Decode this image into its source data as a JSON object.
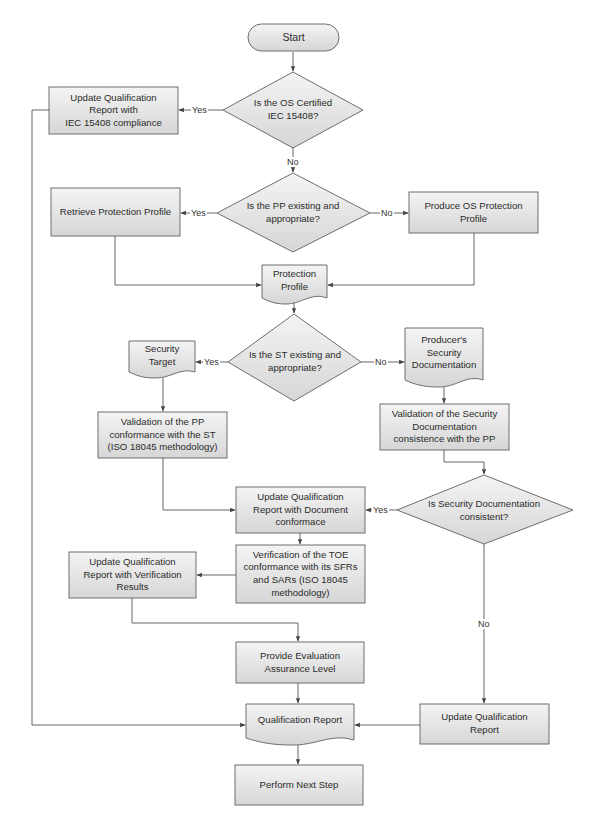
{
  "diagram": {
    "type": "flowchart",
    "colors": {
      "shape_fill_top": "#f4f4f4",
      "shape_fill_bottom": "#d6d6d6",
      "stroke": "#6e6e6e",
      "line": "#555555",
      "text": "#2b2b2b"
    },
    "nodes": {
      "start": {
        "shape": "terminator",
        "label": "Start"
      },
      "q_os_certified": {
        "shape": "decision",
        "label": "Is the OS Certified\nIEC 15408?"
      },
      "update_qr_iec": {
        "shape": "process",
        "label": "Update Qualification\nReport with\nIEC 15408 compliance"
      },
      "q_pp_existing": {
        "shape": "decision",
        "label": "Is the PP existing and\nappropriate?"
      },
      "retrieve_pp": {
        "shape": "process",
        "label": "Retrieve Protection Profile"
      },
      "produce_os_pp": {
        "shape": "process",
        "label": "Produce OS Protection\nProfile"
      },
      "protection_profile": {
        "shape": "document",
        "label": "Protection\nProfile"
      },
      "q_st_existing": {
        "shape": "decision",
        "label": "Is the ST existing and\nappropriate?"
      },
      "security_target": {
        "shape": "document",
        "label": "Security\nTarget"
      },
      "producers_sec_doc": {
        "shape": "document",
        "label": "Producer's\nSecurity\nDocumentation"
      },
      "validation_pp_st": {
        "shape": "process",
        "label": "Validation of the PP\nconformance with the ST\n(ISO 18045 methodology)"
      },
      "validation_secdoc": {
        "shape": "process",
        "label": "Validation of the Security\nDocumentation\nconsistence with the PP"
      },
      "update_qr_doc": {
        "shape": "process",
        "label": "Update Qualification\nReport with Document\nconformace"
      },
      "q_secdoc_consistent": {
        "shape": "decision",
        "label": "Is Security Documentation\nconsistent?"
      },
      "verification_toe": {
        "shape": "process",
        "label": "Verification of the TOE\nconformance with its SFRs\nand SARs  (ISO 18045\nmethodology)"
      },
      "update_qr_verif": {
        "shape": "process",
        "label": "Update Qualification\nReport with Verification\nResults"
      },
      "provide_eal": {
        "shape": "process",
        "label": "Provide Evaluation\nAssurance Level"
      },
      "qualification_report": {
        "shape": "document",
        "label": "Qualification Report"
      },
      "update_qr": {
        "shape": "process",
        "label": "Update Qualification\nReport"
      },
      "perform_next_step": {
        "shape": "process",
        "label": "Perform Next Step"
      }
    },
    "edge_labels": {
      "yes": "Yes",
      "no": "No"
    },
    "edges": [
      {
        "from": "start",
        "to": "q_os_certified",
        "label": ""
      },
      {
        "from": "q_os_certified",
        "to": "update_qr_iec",
        "label": "Yes"
      },
      {
        "from": "q_os_certified",
        "to": "q_pp_existing",
        "label": "No"
      },
      {
        "from": "update_qr_iec",
        "to": "qualification_report",
        "label": ""
      },
      {
        "from": "q_pp_existing",
        "to": "retrieve_pp",
        "label": "Yes"
      },
      {
        "from": "q_pp_existing",
        "to": "produce_os_pp",
        "label": "No"
      },
      {
        "from": "retrieve_pp",
        "to": "protection_profile",
        "label": ""
      },
      {
        "from": "produce_os_pp",
        "to": "protection_profile",
        "label": ""
      },
      {
        "from": "protection_profile",
        "to": "q_st_existing",
        "label": ""
      },
      {
        "from": "q_st_existing",
        "to": "security_target",
        "label": "Yes"
      },
      {
        "from": "q_st_existing",
        "to": "producers_sec_doc",
        "label": "No"
      },
      {
        "from": "security_target",
        "to": "validation_pp_st",
        "label": ""
      },
      {
        "from": "producers_sec_doc",
        "to": "validation_secdoc",
        "label": ""
      },
      {
        "from": "validation_pp_st",
        "to": "update_qr_doc",
        "label": ""
      },
      {
        "from": "validation_secdoc",
        "to": "q_secdoc_consistent",
        "label": ""
      },
      {
        "from": "q_secdoc_consistent",
        "to": "update_qr_doc",
        "label": "Yes"
      },
      {
        "from": "q_secdoc_consistent",
        "to": "update_qr",
        "label": "No"
      },
      {
        "from": "update_qr_doc",
        "to": "verification_toe",
        "label": ""
      },
      {
        "from": "verification_toe",
        "to": "update_qr_verif",
        "label": ""
      },
      {
        "from": "update_qr_verif",
        "to": "provide_eal",
        "label": ""
      },
      {
        "from": "provide_eal",
        "to": "qualification_report",
        "label": ""
      },
      {
        "from": "update_qr",
        "to": "qualification_report",
        "label": ""
      },
      {
        "from": "qualification_report",
        "to": "perform_next_step",
        "label": ""
      }
    ]
  }
}
